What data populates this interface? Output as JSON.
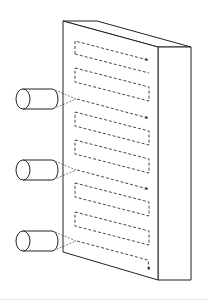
{
  "diagram": {
    "colors": {
      "stroke": "#222222",
      "dash": "#333333",
      "background": "#ffffff",
      "rule": "#e6e6e6"
    },
    "panel": {
      "front": [
        [
          63,
          21
        ],
        [
          158,
          47
        ],
        [
          158,
          280
        ],
        [
          63,
          252
        ]
      ],
      "top": [
        [
          63,
          21
        ],
        [
          97,
          21
        ],
        [
          191,
          47
        ],
        [
          158,
          47
        ]
      ],
      "side": [
        [
          158,
          47
        ],
        [
          191,
          47
        ],
        [
          191,
          280
        ],
        [
          158,
          280
        ]
      ]
    },
    "emitters": [
      {
        "label": "emitter-1",
        "cx": 23,
        "cy": 99
      },
      {
        "label": "emitter-2",
        "cx": 23,
        "cy": 170
      },
      {
        "label": "emitter-3",
        "cx": 23,
        "cy": 241
      }
    ],
    "scan_groups": [
      {
        "y": 41,
        "arrow": true
      },
      {
        "y": 99,
        "arrow": true
      },
      {
        "y": 170,
        "arrow": true
      },
      {
        "y": 241,
        "arrow": true
      }
    ],
    "loops": [
      {
        "y": 68
      },
      {
        "y": 126
      },
      {
        "y": 140
      },
      {
        "y": 197
      },
      {
        "y": 212
      }
    ]
  }
}
